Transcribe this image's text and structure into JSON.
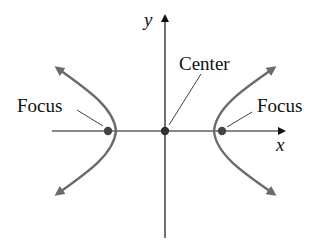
{
  "diagram": {
    "type": "hyperbola",
    "axes": {
      "x_label": "x",
      "y_label": "y"
    },
    "labels": {
      "center": "Center",
      "focus_left": "Focus",
      "focus_right": "Focus"
    },
    "colors": {
      "axis": "#111111",
      "curve": "#6b6b6b",
      "dot": "#444444"
    }
  }
}
